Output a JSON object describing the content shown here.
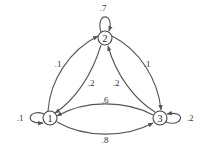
{
  "diagram": {
    "type": "markov-chain-state-diagram",
    "nodes": [
      {
        "id": "1",
        "label": "1"
      },
      {
        "id": "2",
        "label": "2"
      },
      {
        "id": "3",
        "label": "3"
      }
    ],
    "edges": [
      {
        "from": "1",
        "to": "1",
        "label": ".1"
      },
      {
        "from": "1",
        "to": "2",
        "label": ".1"
      },
      {
        "from": "1",
        "to": "3",
        "label": ".8"
      },
      {
        "from": "2",
        "to": "1",
        "label": ".2"
      },
      {
        "from": "2",
        "to": "2",
        "label": ".7"
      },
      {
        "from": "2",
        "to": "3",
        "label": ".1"
      },
      {
        "from": "3",
        "to": "1",
        "label": ".6"
      },
      {
        "from": "3",
        "to": "2",
        "label": ".2"
      },
      {
        "from": "3",
        "to": "3",
        "label": ".2"
      }
    ],
    "colors": {
      "stroke": "#555555",
      "node_fill": "#ffffff",
      "text": "#222222"
    }
  }
}
